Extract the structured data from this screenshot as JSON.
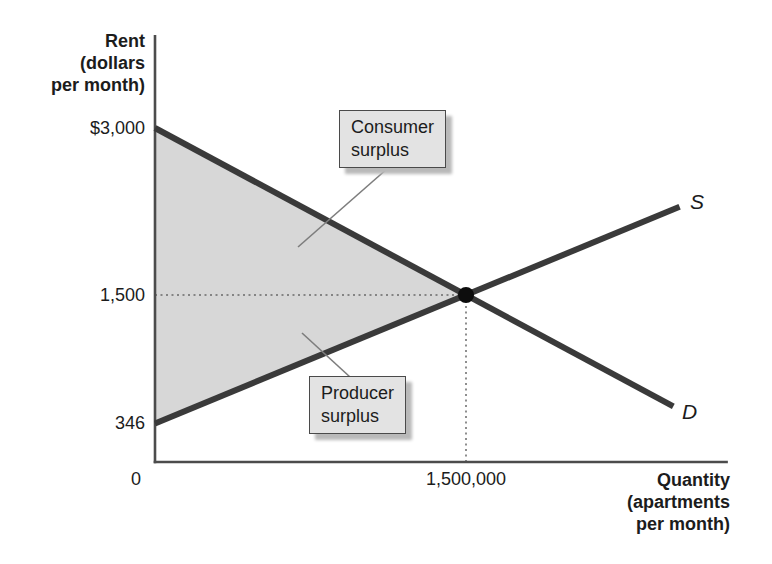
{
  "style": {
    "background": "#ffffff",
    "curve_color": "#3a3a3a",
    "axis_color": "#4c4c4c",
    "shade_color": "#d7d7d7",
    "box_fill": "#e3e3e3",
    "box_border": "#4a4a4a",
    "box_shadow": "#b9b9b9",
    "dotted_color": "#6a6a6a",
    "pointer_color": "#7d7d7d",
    "dot_color": "#0d0d0d",
    "text_color": "#1c1c1c"
  },
  "chart_data": {
    "type": "line",
    "title": "",
    "xlabel": "Quantity\n(apartments\nper month)",
    "ylabel": "Rent\n(dollars\nper month)",
    "xlim": [
      0,
      2763000
    ],
    "ylim": [
      0,
      3835
    ],
    "grid": false,
    "legend": "none",
    "x_ticks": [
      {
        "value": 0,
        "label": "0",
        "dx": -19
      },
      {
        "value": 1500000,
        "label": "1,500,000",
        "dx": 0
      }
    ],
    "y_ticks": [
      {
        "value": 3000,
        "label": "$3,000"
      },
      {
        "value": 1500,
        "label": "1,500"
      },
      {
        "value": 346,
        "label": "346"
      }
    ],
    "series": [
      {
        "name": "demand",
        "label": "D",
        "points": [
          [
            0,
            3000
          ],
          [
            2500000,
            500
          ]
        ]
      },
      {
        "name": "supply",
        "label": "S",
        "points": [
          [
            0,
            346
          ],
          [
            2530000,
            2292
          ]
        ]
      }
    ],
    "equilibrium": {
      "x": 1500000,
      "y": 1500,
      "x_label": "1,500,000",
      "y_label": "1,500"
    },
    "shaded_region": {
      "name": "total-surplus",
      "vertices": [
        [
          0,
          3000
        ],
        [
          1500000,
          1500
        ],
        [
          0,
          346
        ]
      ],
      "components": [
        "Consumer surplus",
        "Producer surplus"
      ]
    },
    "annotations": [
      {
        "name": "consumer-surplus",
        "label": "Consumer\nsurplus"
      },
      {
        "name": "producer-surplus",
        "label": "Producer\nsurplus"
      }
    ]
  }
}
